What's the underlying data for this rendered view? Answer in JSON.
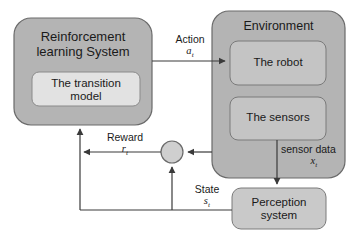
{
  "diagram": {
    "type": "block-diagram",
    "colors": {
      "outer_box_fill": "#b4b4b4",
      "inner_box_fill": "#c4c4c4",
      "light_box_fill": "#e2e2e2",
      "perception_fill": "#c9c9c9",
      "junction_fill": "#cfcfcf",
      "stroke": "#555555",
      "text": "#1a1a1a",
      "background": "#ffffff"
    },
    "nodes": {
      "rl_system": {
        "label": "Reinforcement\nlearning System"
      },
      "transition_model": {
        "label": "The transition\nmodel"
      },
      "environment": {
        "label": "Environment"
      },
      "robot": {
        "label": "The robot"
      },
      "sensors": {
        "label": "The sensors"
      },
      "perception": {
        "label": "Perception\nsystem"
      },
      "junction": {
        "label": ""
      }
    },
    "edges": {
      "action": {
        "label": "Action",
        "symbol": "a",
        "subscript": "t"
      },
      "reward": {
        "label": "Reward",
        "symbol": "r",
        "subscript": "t"
      },
      "state": {
        "label": "State",
        "symbol": "s",
        "subscript": "t"
      },
      "sensor_data": {
        "label": "sensor data",
        "symbol": "x",
        "subscript": "t"
      }
    }
  }
}
